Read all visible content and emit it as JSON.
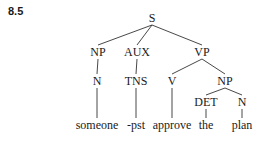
{
  "figure": {
    "label": "8.5"
  },
  "tree": {
    "nodes": [
      {
        "id": "S",
        "label": "S",
        "x": 152,
        "y": 22
      },
      {
        "id": "NP1",
        "label": "NP",
        "x": 98,
        "y": 56
      },
      {
        "id": "AUX",
        "label": "AUX",
        "x": 137,
        "y": 56
      },
      {
        "id": "VP",
        "label": "VP",
        "x": 202,
        "y": 56
      },
      {
        "id": "N1",
        "label": "N",
        "x": 97,
        "y": 85
      },
      {
        "id": "TNS",
        "label": "TNS",
        "x": 136,
        "y": 85
      },
      {
        "id": "V",
        "label": "V",
        "x": 172,
        "y": 85
      },
      {
        "id": "NP2",
        "label": "NP",
        "x": 225,
        "y": 85
      },
      {
        "id": "DET",
        "label": "DET",
        "x": 206,
        "y": 106
      },
      {
        "id": "N2",
        "label": "N",
        "x": 242,
        "y": 106
      }
    ],
    "leaves": [
      {
        "id": "w1",
        "label": "someone",
        "x": 97,
        "y": 129
      },
      {
        "id": "w2",
        "label": "-pst",
        "x": 136,
        "y": 129
      },
      {
        "id": "w3",
        "label": "approve",
        "x": 172,
        "y": 129
      },
      {
        "id": "w4",
        "label": "the",
        "x": 206,
        "y": 129
      },
      {
        "id": "w5",
        "label": "plan",
        "x": 242,
        "y": 129
      }
    ],
    "edges": [
      [
        "S",
        "NP1"
      ],
      [
        "S",
        "AUX"
      ],
      [
        "S",
        "VP"
      ],
      [
        "NP1",
        "N1"
      ],
      [
        "AUX",
        "TNS"
      ],
      [
        "VP",
        "V"
      ],
      [
        "VP",
        "NP2"
      ],
      [
        "NP2",
        "DET"
      ],
      [
        "NP2",
        "N2"
      ],
      [
        "N1",
        "w1"
      ],
      [
        "TNS",
        "w2"
      ],
      [
        "V",
        "w3"
      ],
      [
        "DET",
        "w4"
      ],
      [
        "N2",
        "w5"
      ]
    ]
  }
}
